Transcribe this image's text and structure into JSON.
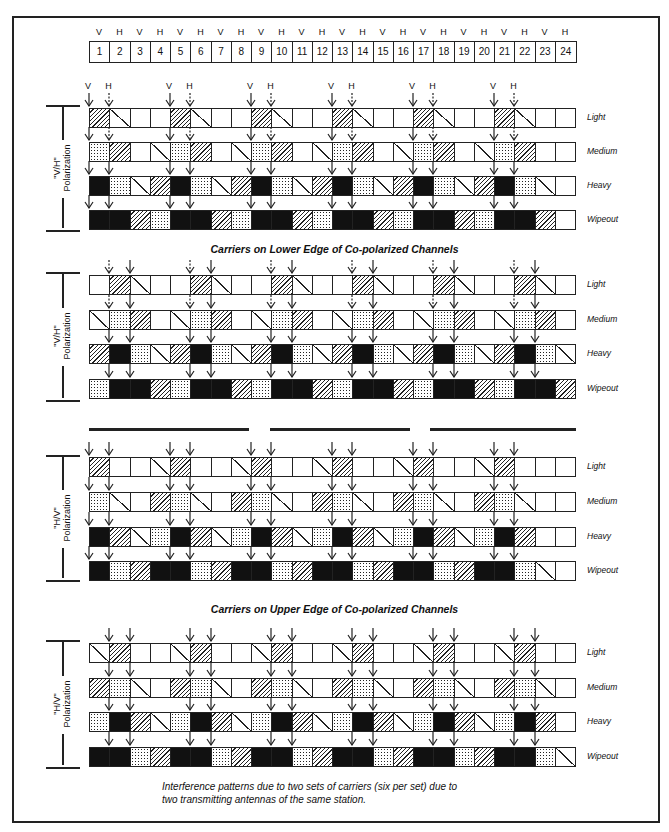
{
  "header": {
    "polarizations": [
      "V",
      "H",
      "V",
      "H",
      "V",
      "H",
      "V",
      "H",
      "V",
      "H",
      "V",
      "H",
      "V",
      "H",
      "V",
      "H",
      "V",
      "H",
      "V",
      "H",
      "V",
      "H",
      "V",
      "H"
    ],
    "channels": [
      "1",
      "2",
      "3",
      "4",
      "5",
      "6",
      "7",
      "8",
      "9",
      "10",
      "11",
      "12",
      "13",
      "14",
      "15",
      "16",
      "17",
      "18",
      "19",
      "20",
      "21",
      "22",
      "23",
      "24"
    ]
  },
  "legend_codes": {
    "E": "clear",
    "S": "slight (diagonal line)",
    "H": "hatched",
    "X": "crosshatched",
    "B": "black (wipeout)"
  },
  "sections": [
    {
      "polarization_label": "\"V/H\"\nPolarization",
      "arrow_offset": 0,
      "arrow_labels": [
        "V",
        "H"
      ],
      "rows": [
        {
          "label": "Light",
          "cells": "HSEEHSEEHSEEHSEEHSEEHSEE"
        },
        {
          "label": "Medium",
          "cells": "XHESXHESXHESXHESXHESXHEE"
        },
        {
          "label": "Heavy",
          "cells": "BXSHBXSHBXSHBXSHBXSHBXSE"
        },
        {
          "label": "Wipeout",
          "cells": "BBHXBBHXBBHXBBHXBBHXBBHE"
        }
      ]
    },
    {
      "polarization_label": "\"V/H\"\nPolarization",
      "arrow_offset": 1,
      "rows": [
        {
          "label": "Light",
          "cells": "EHSEEHSEEHSEEHSEEHSEEHSE"
        },
        {
          "label": "Medium",
          "cells": "SXHESXHESXHESXHESXHESXHE"
        },
        {
          "label": "Heavy",
          "cells": "HBXSHBXSHBXSHBXSHBXSHBXS"
        },
        {
          "label": "Wipeout",
          "cells": "XBBHXBBHXBBHXBBHXBBHXBBH"
        }
      ]
    },
    {
      "polarization_label": "\"H/V\"\nPolarization",
      "arrow_offset": 0,
      "rows": [
        {
          "label": "Light",
          "cells": "HEESHEESHEESHEESHEESHEEE"
        },
        {
          "label": "Medium",
          "cells": "XSEHXSEHXSEHXSEHXSEHXSEE"
        },
        {
          "label": "Heavy",
          "cells": "BHSXBHSXBHSXBHSXBHSXBHEE"
        },
        {
          "label": "Wipeout",
          "cells": "BXHBBXHBBXHBBXHBBXHBBXSE"
        }
      ]
    },
    {
      "polarization_label": "\"H/V\"\nPolarization",
      "arrow_offset": 1,
      "rows": [
        {
          "label": "Light",
          "cells": "SHEESHEESHEESHEESHEESHEE"
        },
        {
          "label": "Medium",
          "cells": "HXSEHXSEHXSEHXSEHXSEHXSE"
        },
        {
          "label": "Heavy",
          "cells": "XBHSXBHSXBHSXBHSXBHSXBHE"
        },
        {
          "label": "Wipeout",
          "cells": "BBXHBBXHBBXHBBXHBBXHBBXS"
        }
      ]
    }
  ],
  "titles": {
    "lower": "Carriers on Lower Edge of Co-polarized Channels",
    "upper": "Carriers on Upper Edge of Co-polarized Channels"
  },
  "caption": {
    "line1": "Interference patterns due to two sets of carriers (six per set) due to",
    "line2": "two transmitting antennas of the same station."
  }
}
